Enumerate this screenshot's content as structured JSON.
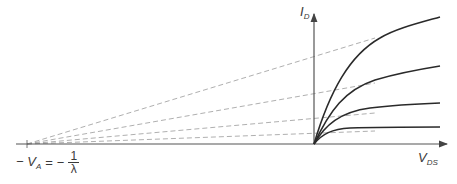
{
  "diagram": {
    "y_axis": {
      "label_main": "I",
      "label_sub": "D"
    },
    "x_axis": {
      "label_main": "V",
      "label_sub": "DS"
    },
    "intercept_label": {
      "left": "− V",
      "left_sub": "A",
      "equals": "=",
      "minus": "−",
      "numerator": "1",
      "denominator": "λ"
    },
    "curves": [
      {
        "name": "curve-1",
        "end_y": 17
      },
      {
        "name": "curve-2",
        "end_y": 66
      },
      {
        "name": "curve-3",
        "end_y": 103
      },
      {
        "name": "curve-4",
        "end_y": 127
      }
    ],
    "colors": {
      "curve": "#2a2a2a",
      "axis": "#555555",
      "dashed": "#999999",
      "text": "#3a3a3a"
    }
  }
}
